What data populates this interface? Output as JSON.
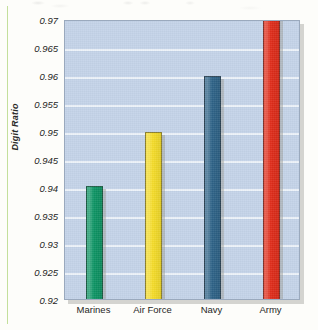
{
  "figure": {
    "y_axis_title": "Digit Ratio"
  },
  "chart_data": {
    "type": "bar",
    "title": "",
    "subtitle": "",
    "xlabel": "",
    "ylabel": "Digit Ratio",
    "categories": [
      "Marines",
      "Air Force",
      "Navy",
      "Army"
    ],
    "values": [
      0.9405,
      0.9501,
      0.9602,
      0.9715
    ],
    "value_notes": [
      "Marines bar top sits just above the 0.94 gridline",
      "Air Force bar top sits on the 0.95 gridline",
      "Navy bar top sits on the 0.96 gridline",
      "Army bar is clipped by the top of the plot area; it extends beyond 0.97"
    ],
    "clipped_bars": [
      "Army"
    ],
    "ylim": [
      0.92,
      0.97
    ],
    "ytick_step": 0.005,
    "ytick_labels": [
      "0.97",
      "0.965",
      "0.96",
      "0.955",
      "0.95",
      "0.945",
      "0.94",
      "0.935",
      "0.93",
      "0.925",
      "0.92"
    ],
    "ytick_values": [
      0.97,
      0.965,
      0.96,
      0.955,
      0.95,
      0.945,
      0.94,
      0.935,
      0.93,
      0.925,
      0.92
    ],
    "series_colors": [
      "#0c9463",
      "#f5dc28",
      "#2d6287",
      "#e02b18"
    ],
    "grid": true,
    "grid_color": "#eef3fa",
    "plot_background": "#c3d2e8",
    "page_background": "#fdfdfa",
    "legend": "none",
    "legend_position": "none"
  }
}
